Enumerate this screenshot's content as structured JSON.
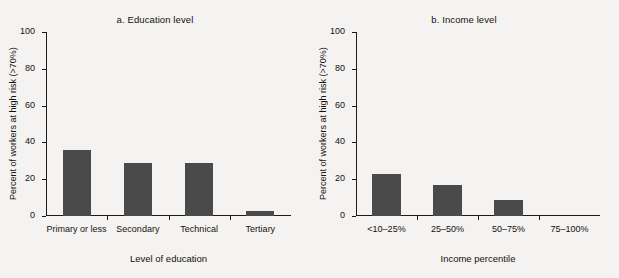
{
  "figure": {
    "background_color": "#f4f3f1",
    "bar_color": "#4a4a4a",
    "axis_color": "#1d1a17"
  },
  "chart_data": [
    {
      "type": "bar",
      "panel_id": "a",
      "title": "a. Education level",
      "xlabel": "Level of education",
      "ylabel": "Percent of workers at high risk (>70%)",
      "categories": [
        "Primary or less",
        "Secondary",
        "Technical",
        "Tertiary"
      ],
      "values": [
        36,
        29,
        29,
        2.5
      ],
      "ylim": [
        0,
        100
      ],
      "yticks": [
        0,
        20,
        40,
        60,
        80,
        100
      ],
      "ytick_labels": [
        "0",
        "20",
        "40",
        "60",
        "80",
        "100"
      ],
      "grid": false,
      "legend": false
    },
    {
      "type": "bar",
      "panel_id": "b",
      "title": "b. Income level",
      "xlabel": "Income percentile",
      "ylabel": "Percent of workers at high risk (>70%)",
      "categories": [
        "<10–25%",
        "25–50%",
        "50–75%",
        "75–100%"
      ],
      "values": [
        23,
        17,
        8.5,
        0
      ],
      "ylim": [
        0,
        100
      ],
      "yticks": [
        0,
        20,
        40,
        60,
        80,
        100
      ],
      "ytick_labels": [
        "0",
        "20",
        "40",
        "60",
        "80",
        "100"
      ],
      "grid": false,
      "legend": false
    }
  ]
}
